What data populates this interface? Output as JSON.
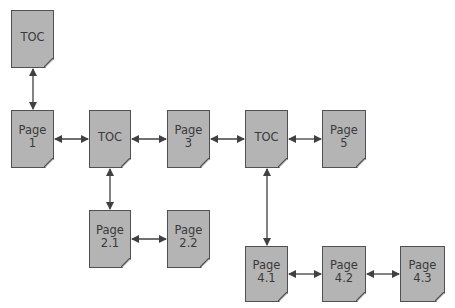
{
  "diagram": {
    "title": "",
    "colors": {
      "node_fill": "#b4b4b4",
      "node_border": "#505050",
      "arrow": "#404040",
      "text": "#3a3a3a"
    },
    "nodes": [
      {
        "id": "toc_top",
        "label": "TOC",
        "x": 11,
        "y": 10,
        "w": 43,
        "h": 58
      },
      {
        "id": "page_1",
        "label": "Page\n1",
        "x": 11,
        "y": 110,
        "w": 43,
        "h": 58
      },
      {
        "id": "toc_2",
        "label": "TOC",
        "x": 89,
        "y": 110,
        "w": 42,
        "h": 58
      },
      {
        "id": "page_3",
        "label": "Page\n3",
        "x": 167,
        "y": 110,
        "w": 43,
        "h": 58
      },
      {
        "id": "toc_4",
        "label": "TOC",
        "x": 245,
        "y": 110,
        "w": 43,
        "h": 58
      },
      {
        "id": "page_5",
        "label": "Page\n5",
        "x": 322,
        "y": 110,
        "w": 44,
        "h": 58
      },
      {
        "id": "page_2_1",
        "label": "Page\n2.1",
        "x": 89,
        "y": 210,
        "w": 42,
        "h": 58
      },
      {
        "id": "page_2_2",
        "label": "Page\n2.2",
        "x": 167,
        "y": 210,
        "w": 43,
        "h": 58
      },
      {
        "id": "page_4_1",
        "label": "Page\n4.1",
        "x": 245,
        "y": 246,
        "w": 43,
        "h": 56
      },
      {
        "id": "page_4_2",
        "label": "Page\n4.2",
        "x": 322,
        "y": 246,
        "w": 44,
        "h": 56
      },
      {
        "id": "page_4_3",
        "label": "Page\n4.3",
        "x": 400,
        "y": 246,
        "w": 45,
        "h": 56
      }
    ],
    "edges": [
      {
        "from": "toc_top",
        "to": "page_1",
        "type": "bidirectional"
      },
      {
        "from": "page_1",
        "to": "toc_2",
        "type": "bidirectional"
      },
      {
        "from": "toc_2",
        "to": "page_3",
        "type": "bidirectional"
      },
      {
        "from": "page_3",
        "to": "toc_4",
        "type": "bidirectional"
      },
      {
        "from": "toc_4",
        "to": "page_5",
        "type": "bidirectional"
      },
      {
        "from": "toc_2",
        "to": "page_2_1",
        "type": "bidirectional"
      },
      {
        "from": "page_2_1",
        "to": "page_2_2",
        "type": "bidirectional"
      },
      {
        "from": "toc_4",
        "to": "page_4_1",
        "type": "bidirectional"
      },
      {
        "from": "page_4_1",
        "to": "page_4_2",
        "type": "bidirectional"
      },
      {
        "from": "page_4_2",
        "to": "page_4_3",
        "type": "bidirectional"
      }
    ]
  }
}
